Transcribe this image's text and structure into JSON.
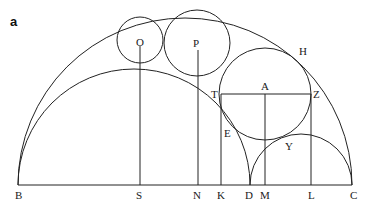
{
  "panel_label": "a",
  "diagram": {
    "stroke_color": "#222222",
    "background": "#ffffff",
    "baseline": {
      "from": "B",
      "to": "C"
    },
    "semicircles": [
      {
        "name": "outer",
        "diameter": [
          "B",
          "C"
        ]
      },
      {
        "name": "inner-left",
        "diameter": [
          "B",
          "D"
        ]
      },
      {
        "name": "inner-right",
        "diameter": [
          "D",
          "C"
        ]
      }
    ],
    "circles": [
      {
        "name": "O",
        "foot": "S"
      },
      {
        "name": "P",
        "foot": "N"
      },
      {
        "name": "A",
        "foot": "M",
        "diameter_line": [
          "T",
          "Z"
        ]
      }
    ],
    "perpendiculars": [
      {
        "from": "O",
        "to": "S"
      },
      {
        "from": "P",
        "to": "N"
      },
      {
        "from": "T",
        "to": "K"
      },
      {
        "from": "A",
        "to": "M"
      },
      {
        "from": "Z",
        "to": "L"
      }
    ]
  },
  "labels": {
    "B": "B",
    "S": "S",
    "N": "N",
    "K": "K",
    "D": "D",
    "M": "M",
    "L": "L",
    "C": "C",
    "O": "O",
    "P": "P",
    "A": "A",
    "T": "T",
    "Z": "Z",
    "H": "H",
    "E": "E",
    "Y": "Y"
  }
}
